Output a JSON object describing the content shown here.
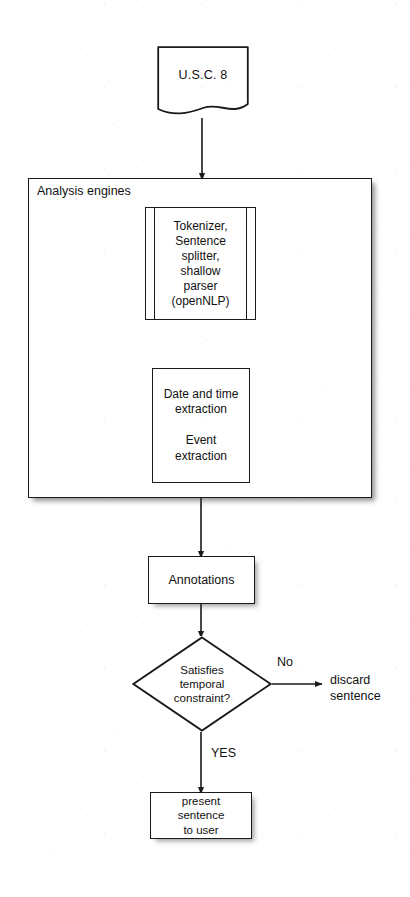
{
  "diagram": {
    "background_color": "#ffffff",
    "stroke_color": "#1a1a1a",
    "nodes": {
      "source_document": {
        "shape": "document",
        "label": "U.S.C. 8"
      },
      "engines_container": {
        "shape": "rectangle",
        "label": "Analysis engines"
      },
      "nlp_process": {
        "shape": "predefined-process",
        "label": "Tokenizer,\nSentence\nsplitter,\nshallow\nparser\n(openNLP)"
      },
      "extraction_process": {
        "shape": "rectangle",
        "label": "Date and time\nextraction\n\nEvent\nextraction"
      },
      "annotations": {
        "shape": "rectangle",
        "label": "Annotations"
      },
      "decision": {
        "shape": "diamond",
        "label": "Satisfies\ntemporal\nconstraint?"
      },
      "present": {
        "shape": "rectangle",
        "label": "present\nsentence\nto user"
      },
      "discard": {
        "shape": "text",
        "label": "discard\nsentence"
      }
    },
    "edge_labels": {
      "no": "No",
      "yes": "YES"
    }
  }
}
